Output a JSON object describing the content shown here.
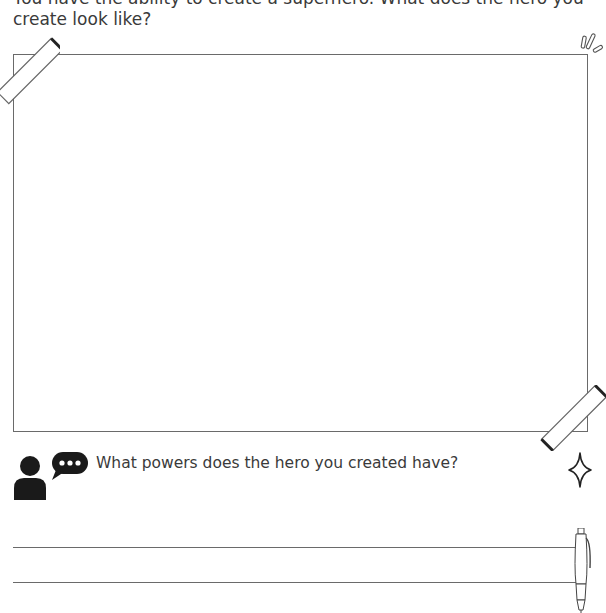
{
  "worksheet": {
    "prompt_text": "You have the ability to create a superhero. What does the hero you create look like?",
    "drawing_area": {
      "label": "drawing-box"
    },
    "question": {
      "text": "What powers does the hero you created have?",
      "icon": "person-speech-bubble-icon"
    },
    "answer_lines": [
      {
        "value": ""
      },
      {
        "value": ""
      }
    ],
    "decorations": [
      "tape-top-left",
      "tape-bottom-right",
      "sparkle-lines-icon",
      "four-point-star-icon",
      "pen-icon"
    ]
  }
}
